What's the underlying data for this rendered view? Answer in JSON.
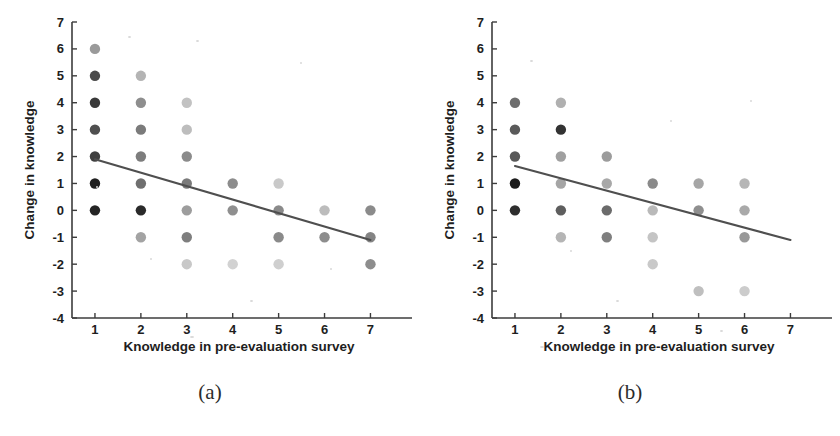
{
  "figure": {
    "panels": [
      {
        "caption": "(a)",
        "xlabel": "Knowledge in pre-evaluation survey",
        "ylabel": "Change in knowledge"
      },
      {
        "caption": "(b)",
        "xlabel": "Knowledge in pre-evaluation survey",
        "ylabel": "Change in knowledge"
      }
    ]
  },
  "chart_data": [
    {
      "type": "scatter",
      "panel": "(a)",
      "title": "",
      "xlabel": "Knowledge in pre-evaluation survey",
      "ylabel": "Change in knowledge",
      "xlim": [
        0.5,
        7.6
      ],
      "ylim": [
        -4,
        7
      ],
      "xticks": [
        1,
        2,
        3,
        4,
        5,
        6,
        7
      ],
      "yticks": [
        -4,
        -3,
        -2,
        -1,
        0,
        1,
        2,
        3,
        4,
        5,
        6,
        7
      ],
      "grid": false,
      "legend": "none",
      "marker": "filled-circle",
      "points": [
        {
          "x": 1,
          "y": 6,
          "shade": "#9a9a9a"
        },
        {
          "x": 1,
          "y": 5,
          "shade": "#4a4a4a"
        },
        {
          "x": 1,
          "y": 4,
          "shade": "#3a3a3a"
        },
        {
          "x": 1,
          "y": 3,
          "shade": "#4f4f4f"
        },
        {
          "x": 1,
          "y": 2,
          "shade": "#3f3f3f"
        },
        {
          "x": 1,
          "y": 1,
          "shade": "#1f1f1f"
        },
        {
          "x": 1,
          "y": 0,
          "shade": "#242424"
        },
        {
          "x": 2,
          "y": 5,
          "shade": "#b4b4b4"
        },
        {
          "x": 2,
          "y": 4,
          "shade": "#8e8e8e"
        },
        {
          "x": 2,
          "y": 3,
          "shade": "#7b7b7b"
        },
        {
          "x": 2,
          "y": 2,
          "shade": "#7d7d7d"
        },
        {
          "x": 2,
          "y": 1,
          "shade": "#6f6f6f"
        },
        {
          "x": 2,
          "y": 0,
          "shade": "#2a2a2a"
        },
        {
          "x": 2,
          "y": -1,
          "shade": "#a3a3a3"
        },
        {
          "x": 3,
          "y": 4,
          "shade": "#c2c2c2"
        },
        {
          "x": 3,
          "y": 3,
          "shade": "#bdbdbd"
        },
        {
          "x": 3,
          "y": 2,
          "shade": "#8b8b8b"
        },
        {
          "x": 3,
          "y": 1,
          "shade": "#7a7a7a"
        },
        {
          "x": 3,
          "y": 0,
          "shade": "#9d9d9d"
        },
        {
          "x": 3,
          "y": -1,
          "shade": "#7e7e7e"
        },
        {
          "x": 3,
          "y": -2,
          "shade": "#c8c8c8"
        },
        {
          "x": 4,
          "y": 1,
          "shade": "#8c8c8c"
        },
        {
          "x": 4,
          "y": 0,
          "shade": "#8f8f8f"
        },
        {
          "x": 4,
          "y": -2,
          "shade": "#d2d2d2"
        },
        {
          "x": 5,
          "y": 1,
          "shade": "#c9c9c9"
        },
        {
          "x": 5,
          "y": 0,
          "shade": "#8a8a8a"
        },
        {
          "x": 5,
          "y": -1,
          "shade": "#8a8a8a"
        },
        {
          "x": 5,
          "y": -2,
          "shade": "#cfcfcf"
        },
        {
          "x": 6,
          "y": 0,
          "shade": "#bcbcbc"
        },
        {
          "x": 6,
          "y": -1,
          "shade": "#8d8d8d"
        },
        {
          "x": 7,
          "y": 0,
          "shade": "#8b8b8b"
        },
        {
          "x": 7,
          "y": -1,
          "shade": "#848484"
        },
        {
          "x": 7,
          "y": -2,
          "shade": "#8d8d8d"
        }
      ],
      "fit_line": {
        "x0": 1,
        "y0": 1.9,
        "x1": 7,
        "y1": -1.1,
        "color": "#4f4f4f"
      }
    },
    {
      "type": "scatter",
      "panel": "(b)",
      "title": "",
      "xlabel": "Knowledge in pre-evaluation survey",
      "ylabel": "Change in knowledge",
      "xlim": [
        0.5,
        7.6
      ],
      "ylim": [
        -4,
        7
      ],
      "xticks": [
        1,
        2,
        3,
        4,
        5,
        6,
        7
      ],
      "yticks": [
        -4,
        -3,
        -2,
        -1,
        0,
        1,
        2,
        3,
        4,
        5,
        6,
        7
      ],
      "grid": false,
      "legend": "none",
      "marker": "filled-circle",
      "points": [
        {
          "x": 1,
          "y": 4,
          "shade": "#6e6e6e"
        },
        {
          "x": 1,
          "y": 3,
          "shade": "#5a5a5a"
        },
        {
          "x": 1,
          "y": 2,
          "shade": "#585858"
        },
        {
          "x": 1,
          "y": 1,
          "shade": "#1c1c1c"
        },
        {
          "x": 1,
          "y": 0,
          "shade": "#2e2e2e"
        },
        {
          "x": 2,
          "y": 4,
          "shade": "#b0b0b0"
        },
        {
          "x": 2,
          "y": 3,
          "shade": "#333333"
        },
        {
          "x": 2,
          "y": 2,
          "shade": "#a0a0a0"
        },
        {
          "x": 2,
          "y": 1,
          "shade": "#a5a5a5"
        },
        {
          "x": 2,
          "y": 0,
          "shade": "#5e5e5e"
        },
        {
          "x": 2,
          "y": -1,
          "shade": "#b5b5b5"
        },
        {
          "x": 3,
          "y": 2,
          "shade": "#9c9c9c"
        },
        {
          "x": 3,
          "y": 1,
          "shade": "#a8a8a8"
        },
        {
          "x": 3,
          "y": 0,
          "shade": "#6b6b6b"
        },
        {
          "x": 3,
          "y": -1,
          "shade": "#7f7f7f"
        },
        {
          "x": 4,
          "y": 1,
          "shade": "#8a8a8a"
        },
        {
          "x": 4,
          "y": 0,
          "shade": "#b9b9b9"
        },
        {
          "x": 4,
          "y": -1,
          "shade": "#c4c4c4"
        },
        {
          "x": 4,
          "y": -2,
          "shade": "#c9c9c9"
        },
        {
          "x": 5,
          "y": 1,
          "shade": "#a6a6a6"
        },
        {
          "x": 5,
          "y": 0,
          "shade": "#8f8f8f"
        },
        {
          "x": 5,
          "y": -3,
          "shade": "#bfbfbf"
        },
        {
          "x": 6,
          "y": 1,
          "shade": "#b6b6b6"
        },
        {
          "x": 6,
          "y": 0,
          "shade": "#a9a9a9"
        },
        {
          "x": 6,
          "y": -1,
          "shade": "#999999"
        },
        {
          "x": 6,
          "y": -3,
          "shade": "#cccccc"
        }
      ],
      "fit_line": {
        "x0": 1,
        "y0": 1.65,
        "x1": 7,
        "y1": -1.1,
        "color": "#4f4f4f"
      }
    }
  ]
}
